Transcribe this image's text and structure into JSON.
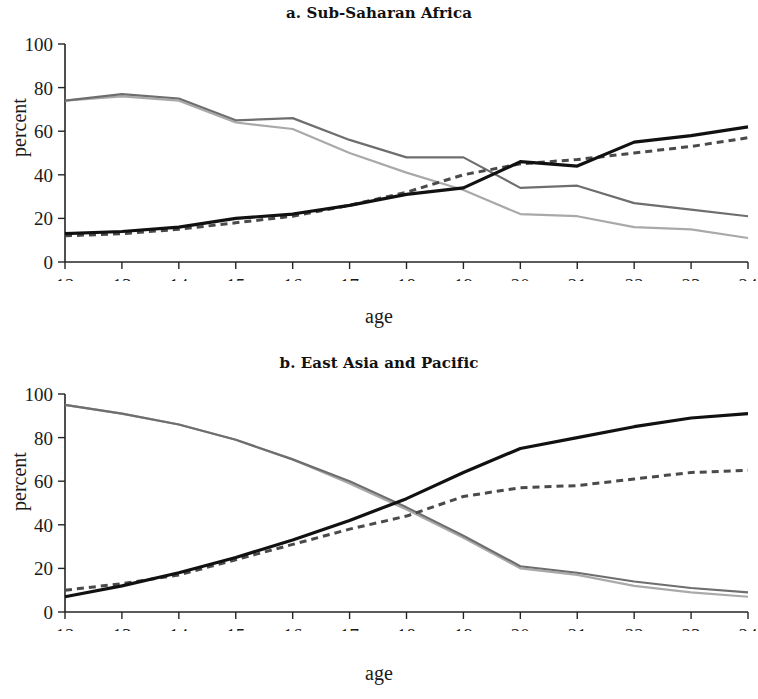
{
  "figure": {
    "background": "#ffffff",
    "panel_count": 2
  },
  "panels": [
    {
      "id": "a",
      "title": "a. Sub-Saharan Africa",
      "xlabel": "age",
      "ylabel": "percent"
    },
    {
      "id": "b",
      "title": "b. East Asia and Pacific",
      "xlabel": "age",
      "ylabel": "percent"
    }
  ],
  "axis": {
    "y_ticks": [
      0,
      20,
      40,
      60,
      80,
      100
    ],
    "x_ticks": [
      12,
      13,
      14,
      15,
      16,
      17,
      18,
      19,
      20,
      21,
      22,
      23,
      24
    ],
    "ylim": [
      0,
      100
    ],
    "xlim": [
      12,
      24
    ]
  },
  "colors": {
    "black_solid": "#111111",
    "dark_dashed": "#4a4a4a",
    "medium_gray": "#6e6e6e",
    "light_gray": "#a9a9a9",
    "axis": "#242424"
  },
  "chart_data": [
    {
      "type": "line",
      "title": "a. Sub-Saharan Africa",
      "xlabel": "age",
      "ylabel": "percent",
      "xlim": [
        12,
        24
      ],
      "ylim": [
        0,
        100
      ],
      "grid": false,
      "legend": "none",
      "x": [
        12,
        13,
        14,
        15,
        16,
        17,
        18,
        19,
        20,
        21,
        22,
        23,
        24
      ],
      "series": [
        {
          "name": "male-rising-solid-black",
          "style": "solid",
          "color": "#111111",
          "values": [
            13,
            14,
            16,
            20,
            22,
            26,
            31,
            34,
            46,
            44,
            55,
            58,
            62
          ]
        },
        {
          "name": "rising-dashed-dark-gray",
          "style": "dashed",
          "color": "#4a4a4a",
          "values": [
            12,
            13,
            15,
            18,
            21,
            26,
            32,
            40,
            45,
            47,
            50,
            53,
            57
          ]
        },
        {
          "name": "falling-medium-gray",
          "style": "solid",
          "color": "#6e6e6e",
          "values": [
            74,
            77,
            75,
            65,
            66,
            56,
            48,
            48,
            34,
            35,
            27,
            24,
            21
          ]
        },
        {
          "name": "falling-light-gray",
          "style": "solid",
          "color": "#a9a9a9",
          "values": [
            74,
            76,
            74,
            64,
            61,
            50,
            41,
            33,
            22,
            21,
            16,
            15,
            11
          ]
        }
      ]
    },
    {
      "type": "line",
      "title": "b. East Asia and Pacific",
      "xlabel": "age",
      "ylabel": "percent",
      "xlim": [
        12,
        24
      ],
      "ylim": [
        0,
        100
      ],
      "grid": false,
      "legend": "none",
      "x": [
        12,
        13,
        14,
        15,
        16,
        17,
        18,
        19,
        20,
        21,
        22,
        23,
        24
      ],
      "series": [
        {
          "name": "rising-solid-black",
          "style": "solid",
          "color": "#111111",
          "values": [
            7,
            12,
            18,
            25,
            33,
            42,
            52,
            64,
            75,
            80,
            85,
            89,
            91
          ]
        },
        {
          "name": "rising-dashed-dark-gray",
          "style": "dashed",
          "color": "#4a4a4a",
          "values": [
            10,
            13,
            17,
            24,
            31,
            38,
            44,
            53,
            57,
            58,
            61,
            64,
            65
          ]
        },
        {
          "name": "falling-medium-gray",
          "style": "solid",
          "color": "#6e6e6e",
          "values": [
            95,
            91,
            86,
            79,
            70,
            60,
            48,
            35,
            21,
            18,
            14,
            11,
            9
          ]
        },
        {
          "name": "falling-light-gray",
          "style": "solid",
          "color": "#a9a9a9",
          "values": [
            95,
            91,
            86,
            79,
            70,
            59,
            47,
            34,
            20,
            17,
            12,
            9,
            7
          ]
        }
      ]
    }
  ]
}
